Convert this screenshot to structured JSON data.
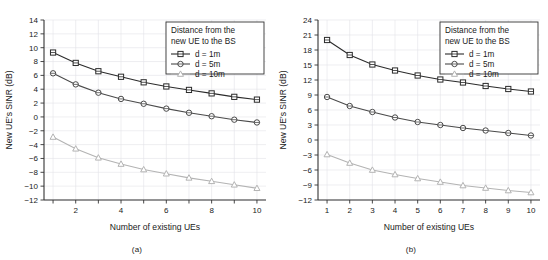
{
  "figure": {
    "panels": [
      {
        "id": "a",
        "caption": "(a)"
      },
      {
        "id": "b",
        "caption": "(b)"
      }
    ]
  },
  "legend": {
    "title_line1": "Distance from the",
    "title_line2": "new UE to the BS",
    "entries": [
      {
        "label": "d = 1m",
        "marker": "square",
        "color": "#2b2b2b"
      },
      {
        "label": "d = 5m",
        "marker": "circle",
        "color": "#4a4a4a"
      },
      {
        "label": "d = 10m",
        "marker": "triangle",
        "color": "#b3b3b3"
      }
    ]
  },
  "chart_data": [
    {
      "type": "line",
      "panel": "a",
      "title": "",
      "xlabel": "Number of existing UEs",
      "ylabel": "New UE's SINR (dB)",
      "x": [
        1,
        2,
        3,
        4,
        5,
        6,
        7,
        8,
        9,
        10
      ],
      "xlim": [
        0.6,
        10.4
      ],
      "xticks": [
        1,
        2,
        3,
        4,
        5,
        6,
        7,
        8,
        9,
        10
      ],
      "xticklabels": [
        "",
        "2",
        "",
        "4",
        "",
        "6",
        "",
        "8",
        "",
        "10"
      ],
      "ylim": [
        -12,
        14
      ],
      "yticks": [
        -12,
        -10,
        -8,
        -6,
        -4,
        -2,
        0,
        2,
        4,
        6,
        8,
        10,
        12,
        14
      ],
      "yticklabels": [
        "-12",
        "-10",
        "-8",
        "-6",
        "-4",
        "-2",
        "0",
        "2",
        "4",
        "6",
        "8",
        "10",
        "12",
        "14"
      ],
      "grid": true,
      "legend_position": "top-right",
      "series": [
        {
          "name": "d = 1m",
          "marker": "square",
          "color": "#2b2b2b",
          "values": [
            9.3,
            7.8,
            6.6,
            5.8,
            5.0,
            4.4,
            3.9,
            3.4,
            2.9,
            2.5
          ]
        },
        {
          "name": "d = 5m",
          "marker": "circle",
          "color": "#4a4a4a",
          "values": [
            6.3,
            4.7,
            3.5,
            2.6,
            1.9,
            1.2,
            0.6,
            0.1,
            -0.4,
            -0.8
          ]
        },
        {
          "name": "d = 10m",
          "marker": "triangle",
          "color": "#b3b3b3",
          "values": [
            -2.9,
            -4.6,
            -5.9,
            -6.8,
            -7.6,
            -8.2,
            -8.8,
            -9.3,
            -9.8,
            -10.3
          ]
        }
      ]
    },
    {
      "type": "line",
      "panel": "b",
      "title": "",
      "xlabel": "Number of existing UEs",
      "ylabel": "New UE's SINR (dB)",
      "x": [
        1,
        2,
        3,
        4,
        5,
        6,
        7,
        8,
        9,
        10
      ],
      "xlim": [
        0.6,
        10.4
      ],
      "xticks": [
        1,
        2,
        3,
        4,
        5,
        6,
        7,
        8,
        9,
        10
      ],
      "xticklabels": [
        "1",
        "2",
        "3",
        "4",
        "5",
        "6",
        "7",
        "8",
        "9",
        "10"
      ],
      "ylim": [
        -12,
        24
      ],
      "yticks": [
        -12,
        -9,
        -6,
        -3,
        0,
        3,
        6,
        9,
        12,
        15,
        18,
        21,
        24
      ],
      "yticklabels": [
        "-12",
        "-9",
        "-6",
        "-3",
        "0",
        "3",
        "6",
        "9",
        "12",
        "15",
        "18",
        "21",
        "24"
      ],
      "grid": true,
      "legend_position": "top-right",
      "series": [
        {
          "name": "d = 1m",
          "marker": "square",
          "color": "#2b2b2b",
          "values": [
            20.0,
            17.0,
            15.1,
            13.9,
            12.9,
            12.1,
            11.5,
            10.8,
            10.2,
            9.7
          ]
        },
        {
          "name": "d = 5m",
          "marker": "circle",
          "color": "#4a4a4a",
          "values": [
            8.6,
            6.8,
            5.6,
            4.5,
            3.6,
            3.0,
            2.4,
            1.9,
            1.4,
            0.9
          ]
        },
        {
          "name": "d = 10m",
          "marker": "triangle",
          "color": "#b3b3b3",
          "values": [
            -2.9,
            -4.6,
            -6.0,
            -6.9,
            -7.7,
            -8.4,
            -9.1,
            -9.6,
            -10.1,
            -10.5
          ]
        }
      ]
    }
  ]
}
